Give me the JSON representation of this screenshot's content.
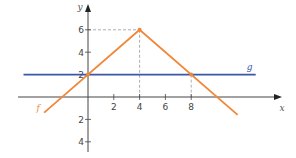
{
  "chart_data": {
    "type": "line",
    "title": "",
    "xlabel": "x",
    "ylabel": "y",
    "xlim": [
      -5.5,
      15
    ],
    "ylim": [
      -4.5,
      7.5
    ],
    "x_ticks": [
      2,
      4,
      6,
      8
    ],
    "x_tick_labels": [
      "2",
      "4",
      "6",
      "8"
    ],
    "y_ticks": [
      6,
      4,
      2,
      -2,
      -4
    ],
    "y_tick_labels": [
      "6",
      "4",
      "2",
      "2",
      "4"
    ],
    "grid": false,
    "series": [
      {
        "name": "f",
        "color": "#f0883a",
        "x": [
          -3.4,
          4,
          11.6
        ],
        "y": [
          -1.4,
          6,
          -1.6
        ]
      },
      {
        "name": "g",
        "color": "#3a57a8",
        "x": [
          -5,
          13
        ],
        "y": [
          2,
          2
        ]
      }
    ],
    "markers": [
      {
        "x": 4,
        "y": 6
      },
      {
        "x": 0,
        "y": 2
      },
      {
        "x": 8,
        "y": 2
      }
    ],
    "guides": [
      {
        "from": [
          0,
          6
        ],
        "to": [
          4,
          6
        ]
      },
      {
        "from": [
          4,
          6
        ],
        "to": [
          4,
          0
        ]
      },
      {
        "from": [
          8,
          2
        ],
        "to": [
          8,
          0
        ]
      }
    ],
    "legend": "inline-labels"
  }
}
